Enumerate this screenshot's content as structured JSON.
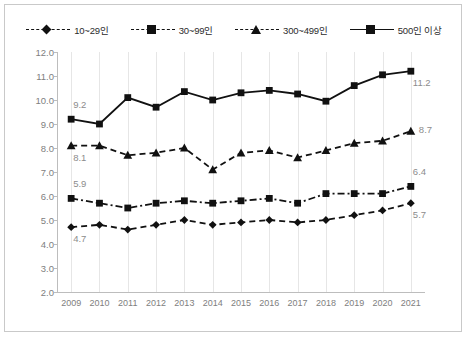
{
  "chart_data": {
    "type": "line",
    "title": "",
    "xlabel": "",
    "ylabel": "",
    "categories": [
      "2009",
      "2010",
      "2011",
      "2012",
      "2013",
      "2014",
      "2015",
      "2016",
      "2017",
      "2018",
      "2019",
      "2020",
      "2021"
    ],
    "ylim": [
      2.0,
      12.0
    ],
    "ystep": 1.0,
    "ytick_labels": [
      "12.0",
      "11.0",
      "10.0",
      "9.0",
      "8.0",
      "7.0",
      "6.0",
      "5.0",
      "4.0",
      "3.0",
      "2.0"
    ],
    "grid": "vertical",
    "legend_position": "top-center",
    "series": [
      {
        "name": "10~29인",
        "marker": "diamond",
        "linestyle": "dashed",
        "color": "#111111",
        "values": [
          4.7,
          4.8,
          4.6,
          4.8,
          5.0,
          4.8,
          4.9,
          5.0,
          4.9,
          5.0,
          5.2,
          5.4,
          5.7
        ],
        "start_label": "4.7",
        "end_label": "5.7"
      },
      {
        "name": "30~99인",
        "marker": "square",
        "linestyle": "dash-dot",
        "color": "#111111",
        "values": [
          5.9,
          5.7,
          5.5,
          5.7,
          5.8,
          5.7,
          5.8,
          5.9,
          5.7,
          6.1,
          6.1,
          6.1,
          6.4
        ],
        "start_label": "5.9",
        "end_label": "6.4"
      },
      {
        "name": "300~499인",
        "marker": "triangle",
        "linestyle": "dashed",
        "color": "#111111",
        "values": [
          8.1,
          8.1,
          7.7,
          7.8,
          8.0,
          7.1,
          7.8,
          7.9,
          7.6,
          7.9,
          8.2,
          8.3,
          8.7
        ],
        "start_label": "8.1",
        "end_label": "8.7"
      },
      {
        "name": "500인 이상",
        "marker": "square",
        "linestyle": "solid",
        "color": "#111111",
        "values": [
          9.2,
          9.0,
          10.1,
          9.7,
          10.35,
          10.0,
          10.3,
          10.4,
          10.25,
          9.95,
          10.6,
          11.05,
          11.2
        ],
        "start_label": "9.2",
        "end_label": "11.2"
      }
    ]
  },
  "legend": {
    "items": [
      {
        "label": "10~29인"
      },
      {
        "label": "30~99인"
      },
      {
        "label": "300~499인"
      },
      {
        "label": "500인 이상"
      }
    ]
  }
}
